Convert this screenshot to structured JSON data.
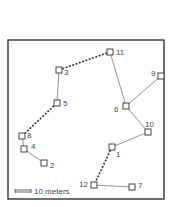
{
  "diagram": {
    "frame": {
      "x": 8,
      "y": 40,
      "width": 156,
      "height": 159,
      "stroke": "#333333"
    },
    "colors": {
      "node": "#444444",
      "solid_edge": "#777777",
      "dashed_edge": "#333333",
      "label": "#444444"
    },
    "nodes": [
      {
        "id": "1",
        "label": "1",
        "x": 112,
        "y": 147,
        "lx": 4,
        "ly": 7
      },
      {
        "id": "2",
        "label": "2",
        "x": 44,
        "y": 163,
        "lx": 6,
        "ly": 2
      },
      {
        "id": "3",
        "label": "3",
        "x": 59,
        "y": 70,
        "lx": 5,
        "ly": 2
      },
      {
        "id": "4",
        "label": "4",
        "x": 24,
        "y": 149,
        "lx": 7,
        "ly": -3
      },
      {
        "id": "5",
        "label": "5",
        "x": 57,
        "y": 103,
        "lx": 6,
        "ly": 0
      },
      {
        "id": "6",
        "label": "6",
        "x": 126,
        "y": 106,
        "lx": -12,
        "ly": 3
      },
      {
        "id": "7",
        "label": "7",
        "x": 132,
        "y": 187,
        "lx": 6,
        "ly": -2
      },
      {
        "id": "8",
        "label": "8",
        "x": 22,
        "y": 136,
        "lx": 5,
        "ly": -1
      },
      {
        "id": "9",
        "label": "9",
        "x": 161,
        "y": 76,
        "lx": -10,
        "ly": -3
      },
      {
        "id": "10",
        "label": "10",
        "x": 148,
        "y": 132,
        "lx": -3,
        "ly": -8
      },
      {
        "id": "11",
        "label": "11",
        "x": 110,
        "y": 52,
        "lx": 6,
        "ly": 0
      },
      {
        "id": "12",
        "label": "12",
        "x": 94,
        "y": 185,
        "lx": -15,
        "ly": -1
      }
    ],
    "edges": [
      {
        "from": "2",
        "to": "4",
        "style": "solid"
      },
      {
        "from": "4",
        "to": "8",
        "style": "solid"
      },
      {
        "from": "8",
        "to": "5",
        "style": "dashed"
      },
      {
        "from": "5",
        "to": "3",
        "style": "solid"
      },
      {
        "from": "3",
        "to": "11",
        "style": "dashed"
      },
      {
        "from": "11",
        "to": "6",
        "style": "solid"
      },
      {
        "from": "6",
        "to": "9",
        "style": "solid"
      },
      {
        "from": "6",
        "to": "10",
        "style": "solid"
      },
      {
        "from": "10",
        "to": "1",
        "style": "solid"
      },
      {
        "from": "1",
        "to": "12",
        "style": "dashed"
      },
      {
        "from": "12",
        "to": "7",
        "style": "solid"
      }
    ],
    "scale_bar": {
      "x1": 15,
      "x2": 31,
      "y": 191,
      "label": "10 meters"
    }
  }
}
